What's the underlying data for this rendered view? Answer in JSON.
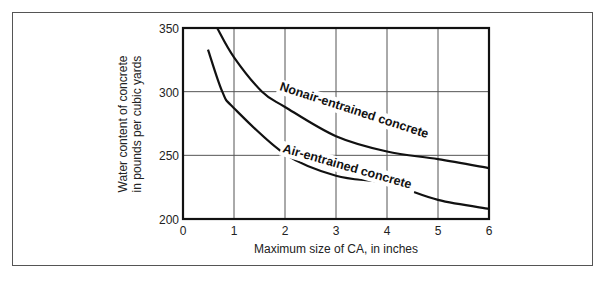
{
  "chart_data": {
    "type": "line",
    "title": "",
    "xlabel": "Maximum size of CA, in inches",
    "ylabel_lines": [
      "Water content of concrete",
      "in pounds per cubic yards"
    ],
    "xlim": [
      0,
      6
    ],
    "ylim": [
      200,
      350
    ],
    "x_ticks": [
      0,
      1,
      2,
      3,
      4,
      5,
      6
    ],
    "y_ticks": [
      200,
      250,
      300,
      350
    ],
    "grid": true,
    "legend": "inline labels on curves",
    "series": [
      {
        "name": "Nonair-entrained concrete",
        "x": [
          0.67,
          1.0,
          1.55,
          2.0,
          3.0,
          4.0,
          5.0,
          6.0
        ],
        "y": [
          350,
          327,
          300,
          288,
          265,
          253,
          247,
          240
        ]
      },
      {
        "name": "Air-entrained concrete",
        "x": [
          0.49,
          0.77,
          1.0,
          2.0,
          3.0,
          4.0,
          5.0,
          6.0
        ],
        "y": [
          333,
          300,
          287,
          251,
          234,
          228,
          215,
          208
        ]
      }
    ]
  },
  "labels": {
    "xlabel": "Maximum size of CA, in inches",
    "ylabel_line1": "Water content of concrete",
    "ylabel_line2": "in pounds per cubic yards",
    "series1": "Nonair-entrained concrete",
    "series2": "Air-entrained concrete"
  }
}
